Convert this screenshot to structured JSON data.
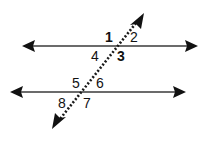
{
  "diagram": {
    "type": "parallel-lines-cut-by-transversal",
    "colors": {
      "line": "#3a3a3a",
      "arrow": "#111111",
      "transversal": "#1a1a1a",
      "background": "#ffffff"
    },
    "lines": [
      {
        "name": "upper-line",
        "style": "solid",
        "arrows": "both"
      },
      {
        "name": "lower-line",
        "style": "solid",
        "arrows": "both"
      },
      {
        "name": "transversal",
        "style": "dotted",
        "arrows": "both"
      }
    ],
    "angle_labels": {
      "a1": "1",
      "a2": "2",
      "a3": "3",
      "a4": "4",
      "a5": "5",
      "a6": "6",
      "a7": "7",
      "a8": "8"
    },
    "bold_labels": [
      "1",
      "3"
    ]
  }
}
